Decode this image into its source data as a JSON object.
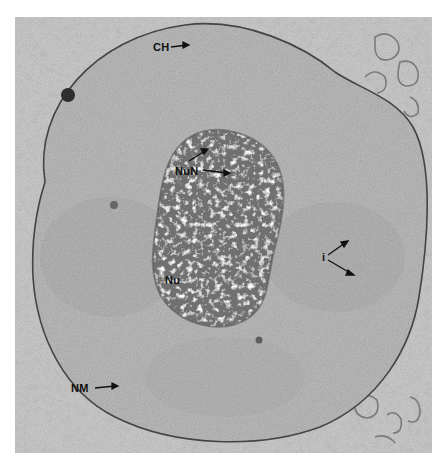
{
  "figure": {
    "type": "transmission electron micrograph",
    "colors": {
      "cytoplasm": "#c4c4c4",
      "nucleoplasm": "#b3b3b3",
      "nucleolus": "#6e6e6e",
      "membrane": "#4a4a4a",
      "background": "#ffffff"
    }
  },
  "labels": {
    "ch": "CH",
    "nun": "NuN",
    "nu": "Nu",
    "i": "i",
    "nm": "NM"
  }
}
